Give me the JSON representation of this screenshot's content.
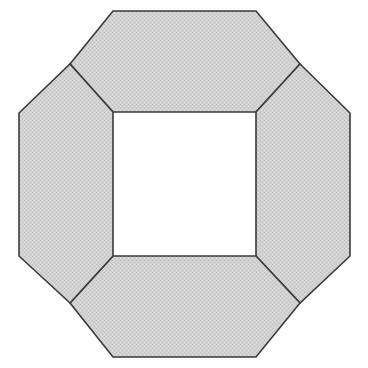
{
  "figure": {
    "title": "Octagonal ring divided into four congruent trapezoidal pieces",
    "shape_type": "regular-octagon-with-square-hole",
    "canvas": {
      "width": 368,
      "height": 368,
      "background": "#ffffff"
    },
    "style": {
      "fill_color": "#cdcdcd",
      "fill_texture": "fine-dither-halftone",
      "stroke_color": "#3a3a3a",
      "stroke_width": 1.6,
      "hole_color": "#ffffff"
    },
    "outer_octagon": {
      "name": "outer-octagon",
      "vertices": [
        {
          "label": "top-left",
          "x": 113,
          "y": 11
        },
        {
          "label": "top-right",
          "x": 256,
          "y": 11
        },
        {
          "label": "right-top",
          "x": 350,
          "y": 113
        },
        {
          "label": "right-bottom",
          "x": 350,
          "y": 256
        },
        {
          "label": "bottom-right",
          "x": 256,
          "y": 357
        },
        {
          "label": "bottom-left",
          "x": 113,
          "y": 357
        },
        {
          "label": "left-bottom",
          "x": 19,
          "y": 256
        },
        {
          "label": "left-top",
          "x": 19,
          "y": 113
        }
      ]
    },
    "inner_square": {
      "name": "inner-square-hole",
      "vertices": [
        {
          "label": "top-left",
          "x": 113,
          "y": 112
        },
        {
          "label": "top-right",
          "x": 256,
          "y": 112
        },
        {
          "label": "bottom-right",
          "x": 256,
          "y": 256
        },
        {
          "label": "bottom-left",
          "x": 113,
          "y": 256
        }
      ],
      "width": 143,
      "height": 144
    },
    "division_junctions": [
      {
        "label": "upper-left-junction",
        "x": 70,
        "y": 64
      },
      {
        "label": "upper-right-junction",
        "x": 300,
        "y": 64
      },
      {
        "label": "lower-right-junction",
        "x": 300,
        "y": 303
      },
      {
        "label": "lower-left-junction",
        "x": 70,
        "y": 303
      }
    ],
    "pieces": [
      {
        "name": "top-piece",
        "points": "70,64 113,11 256,11 300,64 256,112 113,112"
      },
      {
        "name": "right-piece",
        "points": "300,64 350,113 350,256 300,303 256,256 256,112"
      },
      {
        "name": "bottom-piece",
        "points": "300,303 256,357 113,357 70,303 113,256 256,256"
      },
      {
        "name": "left-piece",
        "points": "70,303 19,256 19,113 70,64 113,112 113,256"
      }
    ]
  }
}
